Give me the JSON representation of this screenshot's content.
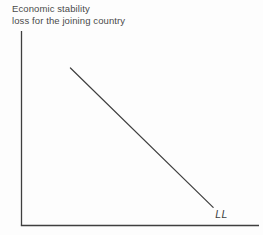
{
  "figure": {
    "y_axis_title_line1": "Economic stability",
    "y_axis_title_line2": "loss for the joining country",
    "curve_label": "LL"
  },
  "colors": {
    "axis": "#3f3f3f",
    "curve": "#3f3f3f",
    "text": "#4a4a4a",
    "background": "#fdfdfd"
  },
  "chart_data": {
    "type": "line",
    "title": "",
    "xlabel": "",
    "ylabel": "Economic stability loss for the joining country",
    "x_range": [
      0,
      1
    ],
    "y_range": [
      0,
      1
    ],
    "grid": false,
    "tick_labels": "none",
    "legend": "none",
    "series": [
      {
        "name": "LL",
        "x": [
          0.206,
          0.807
        ],
        "y": [
          0.81,
          0.093
        ],
        "shape": "straight-line",
        "trend": "downward-sloping",
        "annotation": "LL label at lower-right end of line"
      }
    ]
  }
}
